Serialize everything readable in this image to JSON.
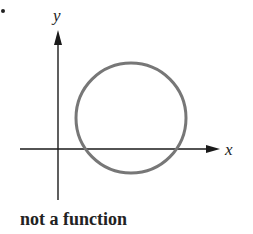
{
  "figure": {
    "marker": ".",
    "x_axis_label": "x",
    "y_axis_label": "y",
    "caption": "not a function",
    "shape": "circle",
    "colors": {
      "axes": "#1a1a1a",
      "circle": "#777777"
    }
  }
}
